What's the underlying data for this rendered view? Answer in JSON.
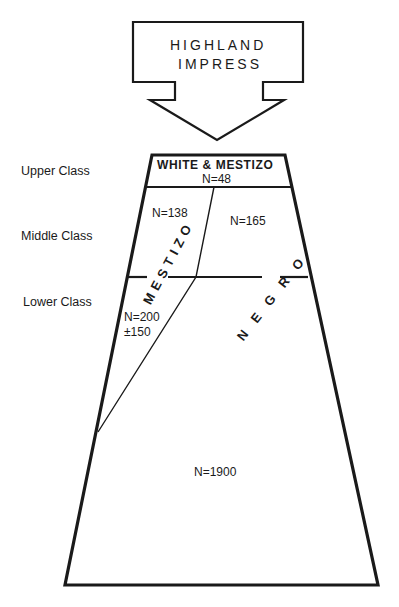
{
  "arrow": {
    "line1": "HIGHLAND",
    "line2": "IMPRESS"
  },
  "class_labels": {
    "upper": "Upper Class",
    "middle": "Middle Class",
    "lower": "Lower Class"
  },
  "regions": {
    "top_group": "WHITE & MESTIZO",
    "top_count": "N=48",
    "mestizo_label": "MESTIZO",
    "mestizo_middle_count": "N=138",
    "mestizo_lower_count_line1": "N=200",
    "mestizo_lower_count_line2": "±150",
    "negro_label": "NEGRO",
    "negro_middle_count": "N=165",
    "negro_lower_count": "N=1900"
  },
  "colors": {
    "ink": "#1a1a1a",
    "background": "#ffffff"
  }
}
